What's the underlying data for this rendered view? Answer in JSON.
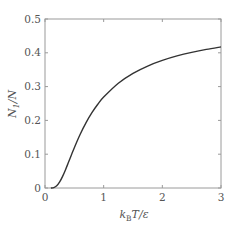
{
  "chart_data": {
    "type": "line",
    "title": "",
    "xlabel": "k_B T / ε",
    "ylabel": "N_1 / N",
    "xlim": [
      0,
      3
    ],
    "ylim": [
      0,
      0.5
    ],
    "xticks": [
      0,
      1,
      2,
      3
    ],
    "yticks": [
      0,
      0.1,
      0.2,
      0.3,
      0.4,
      0.5
    ],
    "xtick_labels": [
      "0",
      "1",
      "2",
      "3"
    ],
    "ytick_labels": [
      "0",
      "0.1",
      "0.2",
      "0.3",
      "0.4",
      "0.5"
    ],
    "grid": false,
    "legend": null,
    "series": [
      {
        "name": "N1/N",
        "color": "#333333",
        "x": [
          0.1,
          0.15,
          0.2,
          0.25,
          0.3,
          0.35,
          0.4,
          0.45,
          0.5,
          0.6,
          0.7,
          0.8,
          0.9,
          1.0,
          1.25,
          1.5,
          1.75,
          2.0,
          2.25,
          2.5,
          2.75,
          3.0
        ],
        "y": [
          0.0,
          0.0013,
          0.0067,
          0.018,
          0.0345,
          0.0543,
          0.0759,
          0.0977,
          0.1192,
          0.1589,
          0.1934,
          0.2227,
          0.2477,
          0.2689,
          0.31,
          0.3392,
          0.3609,
          0.3775,
          0.3907,
          0.4013,
          0.4101,
          0.4174
        ]
      }
    ]
  },
  "labels": {
    "xlabel_main": "k",
    "xlabel_sub": "B",
    "xlabel_rest": "T/ε",
    "ylabel_main": "N",
    "ylabel_sub": "1",
    "ylabel_rest": "/N"
  }
}
